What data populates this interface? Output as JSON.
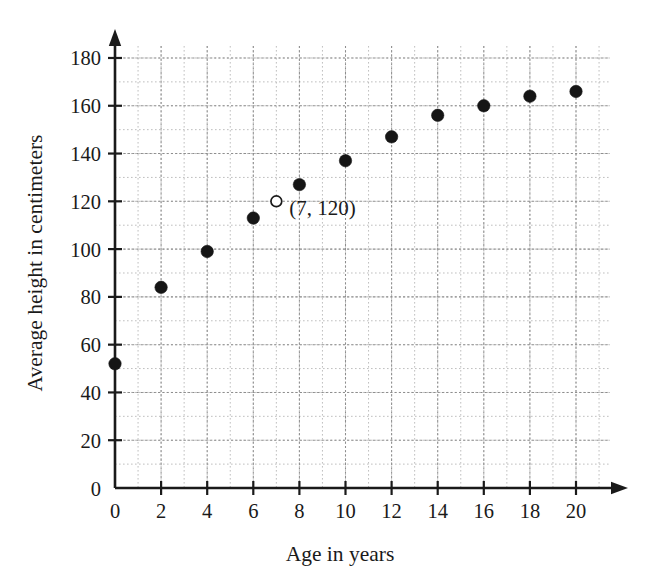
{
  "chart_data": {
    "type": "scatter",
    "title": "",
    "xlabel": "Age in years",
    "ylabel": "Average height in centimeters",
    "xlim": [
      0,
      21
    ],
    "ylim": [
      0,
      185
    ],
    "grid": true,
    "legend": "none",
    "x_ticks": [
      0,
      2,
      4,
      6,
      8,
      10,
      12,
      14,
      16,
      18,
      20
    ],
    "x_tick_labels": [
      "0",
      "2",
      "4",
      "6",
      "8",
      "10",
      "12",
      "14",
      "16",
      "18",
      "20"
    ],
    "y_ticks": [
      0,
      20,
      40,
      60,
      80,
      100,
      120,
      140,
      160,
      180
    ],
    "y_tick_labels": [
      "0",
      "20",
      "40",
      "60",
      "80",
      "100",
      "120",
      "140",
      "160",
      "180"
    ],
    "x_minor_step": 1,
    "y_minor_step": 10,
    "x": [
      0,
      2,
      4,
      6,
      8,
      10,
      12,
      14,
      16,
      18,
      20
    ],
    "values": [
      52,
      84,
      99,
      113,
      127,
      137,
      147,
      156,
      160,
      164,
      166
    ],
    "points": [
      {
        "x": 0,
        "y": 52,
        "style": "filled"
      },
      {
        "x": 2,
        "y": 84,
        "style": "filled"
      },
      {
        "x": 4,
        "y": 99,
        "style": "filled"
      },
      {
        "x": 6,
        "y": 113,
        "style": "filled"
      },
      {
        "x": 8,
        "y": 127,
        "style": "filled"
      },
      {
        "x": 10,
        "y": 137,
        "style": "filled"
      },
      {
        "x": 12,
        "y": 147,
        "style": "filled"
      },
      {
        "x": 14,
        "y": 156,
        "style": "filled"
      },
      {
        "x": 16,
        "y": 160,
        "style": "filled"
      },
      {
        "x": 18,
        "y": 164,
        "style": "filled"
      },
      {
        "x": 20,
        "y": 166,
        "style": "filled"
      }
    ],
    "annotations": [
      {
        "x": 7,
        "y": 120,
        "style": "open",
        "label": "(7, 120)",
        "label_dx": 13,
        "label_dy": 14
      }
    ],
    "colors": {
      "point_fill": "#151515",
      "point_open_fill": "#ffffff",
      "axis": "#1a1a1a",
      "grid_minor": "#b8b8b8",
      "grid_major": "#8e8e8e",
      "background": "#ffffff"
    }
  },
  "geometry": {
    "origin_x": 115,
    "origin_y": 488,
    "px_per_year": 23.05,
    "px_per_cm": 2.389,
    "x_axis_end": 625,
    "y_axis_top": 32,
    "grid_right": 610,
    "grid_top": 46,
    "tick_len": 7,
    "point_radius": 6.2,
    "open_radius": 5.4
  }
}
